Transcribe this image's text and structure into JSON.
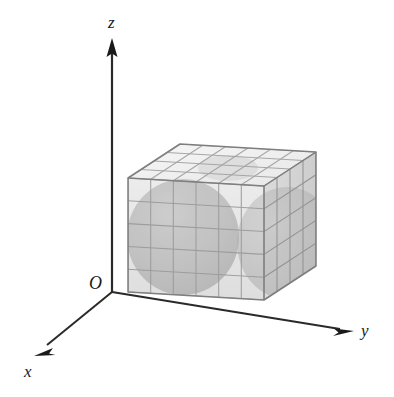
{
  "figure": {
    "type": "3d-coordinate-diagram",
    "background_color": "#ffffff",
    "axes": {
      "origin_label": "O",
      "x_label": "x",
      "y_label": "y",
      "z_label": "z",
      "axis_color": "#1a1a1a",
      "axis_line_width": 2.0,
      "arrowheads": [
        "x",
        "y",
        "z"
      ],
      "origin_point": [
        112,
        292
      ],
      "x_axis_tip": [
        34,
        356
      ],
      "y_axis_tip": [
        352,
        331
      ],
      "z_axis_tip": [
        112,
        41
      ]
    },
    "box": {
      "name": "gridded-rectangular-box",
      "front_face_columns": 6,
      "front_face_rows": 5,
      "depth_cells": 4,
      "edge_color": "#8a8a8a",
      "grid_color": "#9a9a9a",
      "front_face_fill": "#e3e3e3",
      "top_face_fill": "#f1f1f1",
      "right_face_fill": "#d8d8d8",
      "front_bottom_left": [
        128,
        292
      ],
      "front_bottom_right": [
        264,
        300
      ],
      "front_top_left": [
        128,
        178
      ],
      "front_top_right": [
        264,
        186
      ],
      "back_offset": [
        52,
        -34
      ]
    },
    "spheres": [
      {
        "name": "left-inscribed-sphere",
        "center": [
          183,
          237
        ],
        "radius_x": 56,
        "radius_y": 58,
        "fill": "#adadad",
        "opacity": 0.55
      },
      {
        "name": "right-inscribed-sphere",
        "center": [
          287,
          243
        ],
        "radius_x": 50,
        "radius_y": 56,
        "fill": "#adadad",
        "opacity": 0.5
      }
    ],
    "colors": {
      "ink": "#1a1a1a",
      "light_gray": "#ededed",
      "mid_gray": "#cfcfcf",
      "dark_gray": "#a8a8a8",
      "grid_line": "#9b9b9b"
    }
  }
}
